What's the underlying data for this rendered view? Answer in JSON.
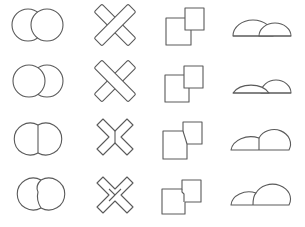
{
  "figure": {
    "columns": [
      {
        "key": "circles",
        "label": "overlapping circles"
      },
      {
        "key": "bars",
        "label": "crossed bars"
      },
      {
        "key": "squares",
        "label": "overlapping squares"
      },
      {
        "key": "domes",
        "label": "overlapping semicircles"
      }
    ],
    "rows": [
      {
        "key": "right-front",
        "label": "right shape in front"
      },
      {
        "key": "left-front",
        "label": "left shape in front"
      },
      {
        "key": "straight-border",
        "label": "straight shared border"
      },
      {
        "key": "notched-border",
        "label": "notched shared border"
      }
    ],
    "colors": {
      "background": "#ffffff",
      "stroke": "#5a5a5a"
    }
  }
}
